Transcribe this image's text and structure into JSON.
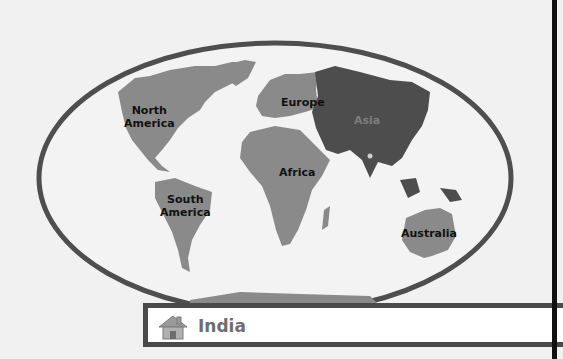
{
  "map": {
    "continents": [
      {
        "name": "north-america",
        "label": "North\nAmerica",
        "color": "#8a8a8a"
      },
      {
        "name": "south-america",
        "label": "South\nAmerica",
        "color": "#8a8a8a"
      },
      {
        "name": "europe",
        "label": "Europe",
        "color": "#8a8a8a"
      },
      {
        "name": "africa",
        "label": "Africa",
        "color": "#8a8a8a"
      },
      {
        "name": "asia",
        "label": "Asia",
        "color": "#4d4d4d"
      },
      {
        "name": "australia",
        "label": "Australia",
        "color": "#8a8a8a"
      }
    ],
    "labels": {
      "north_america_1": "North",
      "north_america_2": "America",
      "south_america_1": "South",
      "south_america_2": "America",
      "europe": "Europe",
      "africa": "Africa",
      "asia": "Asia",
      "australia": "Australia"
    },
    "highlight_marker": "India location dot"
  },
  "location_bar": {
    "icon": "home-icon",
    "label": "India"
  },
  "colors": {
    "background": "#f1f1f1",
    "land": "#8a8a8a",
    "asia": "#4d4d4d",
    "border": "#4a4a4a"
  }
}
